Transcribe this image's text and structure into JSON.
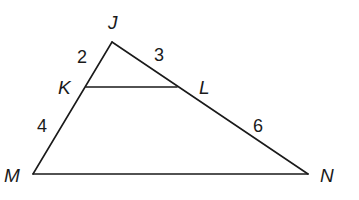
{
  "figure": {
    "type": "triangle-with-parallel-segment",
    "vertices": {
      "J": {
        "label": "J",
        "x": 112,
        "y": 42
      },
      "K": {
        "label": "K",
        "x": 86,
        "y": 87
      },
      "L": {
        "label": "L",
        "x": 177,
        "y": 87
      },
      "M": {
        "label": "M",
        "x": 33,
        "y": 174
      },
      "N": {
        "label": "N",
        "x": 308,
        "y": 174
      }
    },
    "segments": [
      {
        "name": "JK",
        "length": "2"
      },
      {
        "name": "JL",
        "length": "3"
      },
      {
        "name": "KM",
        "length": "4"
      },
      {
        "name": "LN",
        "length": "6"
      },
      {
        "name": "KL",
        "length": ""
      },
      {
        "name": "MN",
        "length": ""
      }
    ],
    "labels": {
      "J": "J",
      "K": "K",
      "L": "L",
      "M": "M",
      "N": "N"
    },
    "lengths": {
      "JK": "2",
      "JL": "3",
      "KM": "4",
      "LN": "6"
    },
    "colors": {
      "stroke": "#1a1a1a",
      "background": "#ffffff"
    }
  }
}
